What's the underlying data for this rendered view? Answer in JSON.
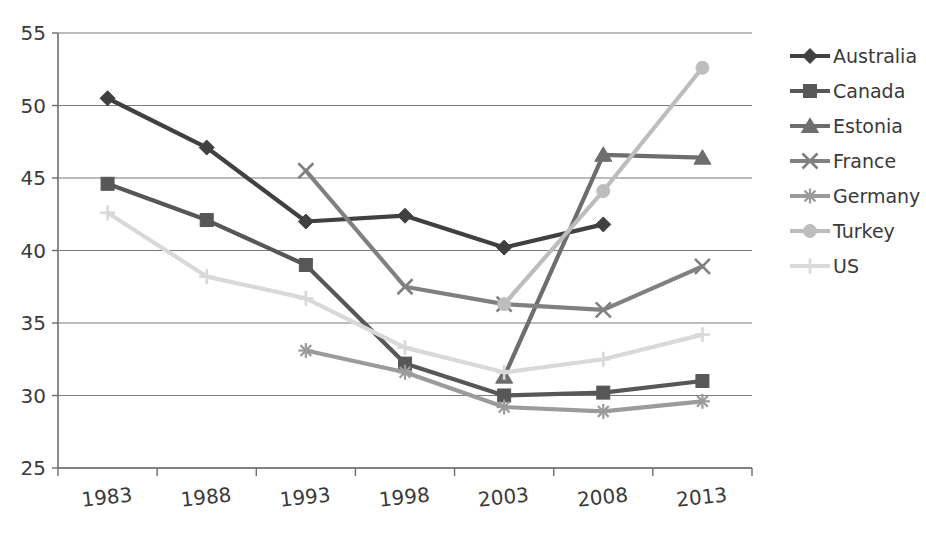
{
  "chart_data": {
    "type": "line",
    "title": "",
    "subtitle": "",
    "xlabel": "",
    "ylabel": "",
    "x": [
      1983,
      1988,
      1993,
      1998,
      2003,
      2008,
      2013
    ],
    "x_tick_labels": [
      "1983",
      "1988",
      "1993",
      "1998",
      "2003",
      "2008",
      "2013"
    ],
    "y_tick_labels": [
      "25",
      "30",
      "35",
      "40",
      "45",
      "50",
      "55"
    ],
    "y_ticks": [
      25,
      30,
      35,
      40,
      45,
      50,
      55
    ],
    "ylim": [
      25,
      55
    ],
    "xlim": [
      1981,
      2015
    ],
    "grid": "horizontal",
    "legend_position": "right",
    "series": [
      {
        "name": "Australia",
        "marker": "diamond",
        "color": "#404040",
        "values": [
          50.5,
          47.1,
          42.0,
          42.4,
          40.2,
          41.8,
          null
        ]
      },
      {
        "name": "Canada",
        "marker": "square",
        "color": "#575757",
        "values": [
          44.6,
          42.1,
          39.0,
          32.2,
          30.0,
          30.2,
          31.0
        ]
      },
      {
        "name": "Estonia",
        "marker": "triangle",
        "color": "#6e6e6e",
        "values": [
          null,
          null,
          null,
          null,
          31.3,
          46.6,
          46.4
        ]
      },
      {
        "name": "France",
        "marker": "cross-x",
        "color": "#808080",
        "values": [
          null,
          null,
          45.5,
          37.5,
          36.3,
          35.9,
          38.9
        ]
      },
      {
        "name": "Germany",
        "marker": "asterisk",
        "color": "#9b9b9b",
        "values": [
          null,
          null,
          33.1,
          31.6,
          29.2,
          28.9,
          29.6
        ]
      },
      {
        "name": "Turkey",
        "marker": "circle",
        "color": "#bdbdbd",
        "values": [
          null,
          null,
          null,
          null,
          36.3,
          44.1,
          52.6
        ]
      },
      {
        "name": "US",
        "marker": "plus",
        "color": "#d9d9d9",
        "values": [
          42.6,
          38.2,
          36.7,
          33.3,
          31.6,
          32.5,
          34.2
        ]
      }
    ]
  },
  "legend": {
    "items": [
      {
        "label": "Australia"
      },
      {
        "label": "Canada"
      },
      {
        "label": "Estonia"
      },
      {
        "label": "France"
      },
      {
        "label": "Germany"
      },
      {
        "label": "Turkey"
      },
      {
        "label": "US"
      }
    ]
  },
  "axes": {
    "y_labels": [
      "55",
      "50",
      "45",
      "40",
      "35",
      "30",
      "25"
    ],
    "x_labels": [
      "1983",
      "1988",
      "1993",
      "1998",
      "2003",
      "2008",
      "2013"
    ]
  },
  "colors": {
    "grid": "#7b7b7b",
    "axis": "#6e6e6e",
    "text": "#3a3a3a",
    "background": "#ffffff"
  }
}
